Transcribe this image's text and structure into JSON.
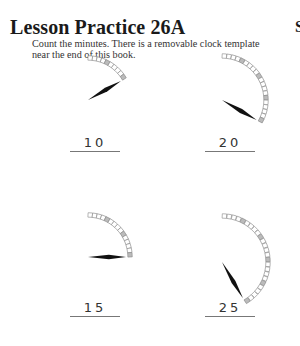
{
  "header": {
    "title": "Lesson Practice 26A",
    "instructions": "Count the minutes. There is a removable clock template near the end of this book.",
    "corner_char": "S"
  },
  "problems": [
    {
      "id": 1,
      "minutes": 10,
      "answer": "10"
    },
    {
      "id": 2,
      "minutes": 20,
      "answer": "20"
    },
    {
      "id": 3,
      "minutes": 15,
      "answer": "15"
    },
    {
      "id": 4,
      "minutes": 25,
      "answer": "25"
    }
  ]
}
